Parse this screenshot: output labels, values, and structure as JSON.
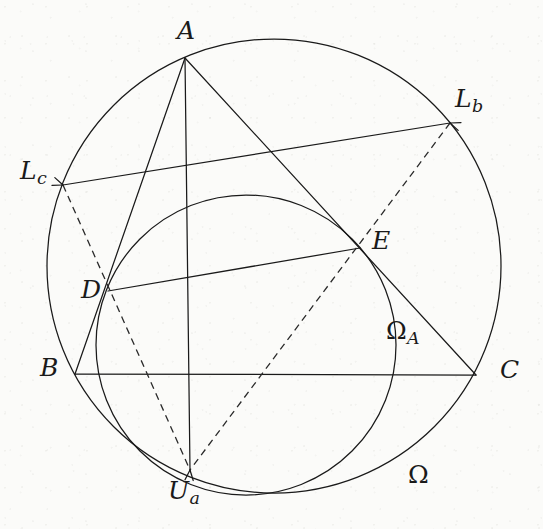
{
  "figure": {
    "background_color": "#fbfbf9",
    "stroke_color": "#1a1a1a",
    "canvas": {
      "width": 543,
      "height": 529
    }
  },
  "circles": [
    {
      "id": "omega",
      "label": "Ω",
      "cx": 274,
      "cy": 266,
      "r": 227,
      "style": "solid"
    },
    {
      "id": "omega-a",
      "label": "Ω",
      "label_sub": "A",
      "cx": 246,
      "cy": 345,
      "r": 150,
      "style": "solid"
    }
  ],
  "points": [
    {
      "id": "A",
      "name": "A",
      "x": 185,
      "y": 58,
      "label": "A",
      "label_sub": "",
      "lx": 177,
      "ly": 18
    },
    {
      "id": "B",
      "name": "B",
      "x": 75,
      "y": 374,
      "label": "B",
      "label_sub": "",
      "lx": 40,
      "ly": 355
    },
    {
      "id": "C",
      "name": "C",
      "x": 476,
      "y": 375,
      "label": "C",
      "label_sub": "",
      "lx": 500,
      "ly": 357
    },
    {
      "id": "D",
      "name": "D",
      "x": 108,
      "y": 291,
      "label": "D",
      "label_sub": "",
      "lx": 81,
      "ly": 277
    },
    {
      "id": "E",
      "name": "E",
      "x": 360,
      "y": 248,
      "label": "E",
      "label_sub": "",
      "lx": 372,
      "ly": 228
    },
    {
      "id": "Lb",
      "name": "L_b",
      "x": 450,
      "y": 123,
      "label": "L",
      "label_sub": "b",
      "lx": 455,
      "ly": 86
    },
    {
      "id": "Lc",
      "name": "L_c",
      "x": 63,
      "y": 185,
      "label": "L",
      "label_sub": "c",
      "lx": 20,
      "ly": 158
    },
    {
      "id": "Ua",
      "name": "U_a",
      "x": 190,
      "y": 470,
      "label": "U",
      "label_sub": "a",
      "lx": 168,
      "ly": 478
    }
  ],
  "circle_labels": [
    {
      "id": "omega-a-label",
      "label": "Ω",
      "label_sub": "A",
      "lx": 386,
      "ly": 318
    },
    {
      "id": "omega-label",
      "label": "Ω",
      "label_sub": "",
      "lx": 408,
      "ly": 462
    }
  ],
  "segments": [
    {
      "id": "AB",
      "name": "segment-A-B",
      "from": "A",
      "to": "B",
      "style": "solid"
    },
    {
      "id": "AC",
      "name": "segment-A-C",
      "from": "A",
      "to": "C",
      "style": "solid"
    },
    {
      "id": "BC",
      "name": "segment-B-C",
      "from": "B",
      "to": "C",
      "style": "solid"
    },
    {
      "id": "AUa",
      "name": "segment-A-Ua",
      "from": "A",
      "to": "Ua",
      "style": "solid"
    },
    {
      "id": "DE",
      "name": "segment-D-E",
      "from": "D",
      "to": "E",
      "style": "solid"
    },
    {
      "id": "LcLb",
      "name": "segment-Lc-Lb",
      "from": "Lc",
      "to": "Lb",
      "style": "solid"
    },
    {
      "id": "LcUa",
      "name": "segment-Lc-Ua",
      "from": "Lc",
      "to": "Ua",
      "style": "dashed"
    },
    {
      "id": "LbUa",
      "name": "segment-Lb-Ua",
      "from": "Lb",
      "to": "Ua",
      "style": "dashed"
    }
  ],
  "arrow_marks": [
    {
      "id": "arrow-Lc",
      "name": "arrowhead-at-Lc",
      "x": 63,
      "y": 185
    },
    {
      "id": "arrow-Lb",
      "name": "arrowhead-at-Lb",
      "x": 450,
      "y": 123
    },
    {
      "id": "arrow-Ua",
      "name": "arrowhead-at-Ua",
      "x": 190,
      "y": 470
    }
  ]
}
